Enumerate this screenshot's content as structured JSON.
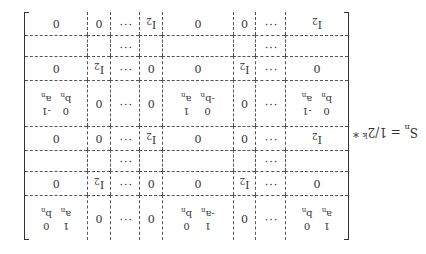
{
  "lhs": {
    "symbol": "S",
    "sub": "n",
    "eq": "= 1/2",
    "exp": "k",
    "star": "*"
  },
  "cells": {
    "I2": "I",
    "I2sub": "2",
    "zero": "0",
    "dots": "···",
    "A": [
      "1",
      "0",
      "a",
      "b"
    ],
    "B": [
      "1",
      "0",
      "-a",
      "b"
    ],
    "C": [
      "0",
      "-1",
      "b",
      "a"
    ],
    "D": [
      "0",
      "1",
      "-b",
      "a"
    ],
    "nsub": "n"
  }
}
